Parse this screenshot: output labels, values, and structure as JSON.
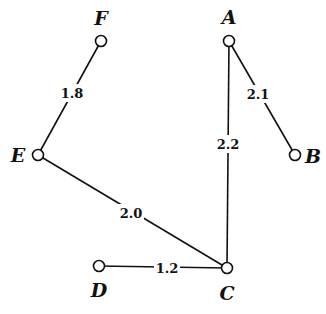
{
  "diagram": {
    "type": "weighted-undirected-graph",
    "nodes": [
      {
        "id": "F",
        "label": "F",
        "x": 101,
        "y": 41,
        "lx": 101,
        "ly": 25
      },
      {
        "id": "A",
        "label": "A",
        "x": 229,
        "y": 41,
        "lx": 229,
        "ly": 24
      },
      {
        "id": "E",
        "label": "E",
        "x": 38,
        "y": 155,
        "lx": 18,
        "ly": 162
      },
      {
        "id": "B",
        "label": "B",
        "x": 295,
        "y": 155,
        "lx": 313,
        "ly": 163
      },
      {
        "id": "D",
        "label": "D",
        "x": 99,
        "y": 266,
        "lx": 99,
        "ly": 297
      },
      {
        "id": "C",
        "label": "C",
        "x": 227,
        "y": 268,
        "lx": 227,
        "ly": 300
      }
    ],
    "edges": [
      {
        "from": "F",
        "to": "E",
        "weight": "1.8",
        "lx": 72,
        "ly": 93
      },
      {
        "from": "A",
        "to": "B",
        "weight": "2.1",
        "lx": 258,
        "ly": 94
      },
      {
        "from": "A",
        "to": "C",
        "weight": "2.2",
        "lx": 228,
        "ly": 144
      },
      {
        "from": "E",
        "to": "C",
        "weight": "2.0",
        "lx": 131,
        "ly": 213
      },
      {
        "from": "D",
        "to": "C",
        "weight": "1.2",
        "lx": 167,
        "ly": 268
      }
    ]
  }
}
